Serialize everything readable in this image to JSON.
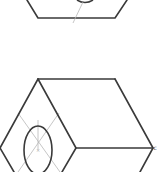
{
  "diagram": {
    "type": "isometric-hexagonal-prism-sketch",
    "colors": {
      "edge": "#3a3a3a",
      "construction": "#b8b8b8",
      "background": "#ffffff"
    },
    "shapes": [
      {
        "name": "upper-prism-partial",
        "visible_portion": "bottom edge with ellipse bottom and construction line"
      },
      {
        "name": "lower-prism",
        "visible_portion": "top face, front hexagonal face with inscribed ellipse and construction diagonals"
      }
    ],
    "labels": {
      "vertex_label": "c"
    }
  }
}
